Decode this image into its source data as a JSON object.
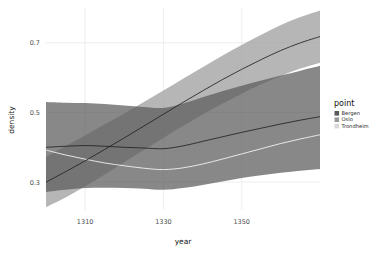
{
  "chart_data": {
    "type": "area",
    "title": "",
    "xlabel": "year",
    "ylabel": "density",
    "xlim": [
      1300,
      1370
    ],
    "ylim": [
      0.22,
      0.8
    ],
    "grid": true,
    "legend_position": "right",
    "legend_title": "point",
    "x_ticks": [
      1310,
      1330,
      1350
    ],
    "x_tick_labels": [
      "1310",
      "1330",
      "1350"
    ],
    "y_ticks": [
      0.3,
      0.5,
      0.7
    ],
    "y_tick_labels": [
      "0.3",
      "0.5",
      "0.7"
    ],
    "colors": {
      "bergen": "#5a5a5a",
      "oslo": "#9a9a9a",
      "trondheim": "#d8d8d8",
      "line": "#222222",
      "panel_background": "#ffffff",
      "grid_line": "#eaeaea",
      "text": "#4d4d4d"
    },
    "x": [
      1300,
      1305,
      1310,
      1315,
      1320,
      1325,
      1330,
      1335,
      1340,
      1345,
      1350,
      1355,
      1360,
      1365,
      1370
    ],
    "series": [
      {
        "name": "Bergen",
        "color": "#5a5a5a",
        "fit": [
          0.4,
          0.403,
          0.405,
          0.403,
          0.4,
          0.398,
          0.396,
          0.404,
          0.417,
          0.43,
          0.443,
          0.455,
          0.467,
          0.478,
          0.488
        ],
        "lower": [
          0.272,
          0.278,
          0.283,
          0.284,
          0.283,
          0.281,
          0.278,
          0.283,
          0.292,
          0.302,
          0.312,
          0.32,
          0.327,
          0.333,
          0.338
        ],
        "upper": [
          0.53,
          0.528,
          0.527,
          0.524,
          0.52,
          0.516,
          0.513,
          0.526,
          0.544,
          0.561,
          0.577,
          0.592,
          0.606,
          0.62,
          0.634
        ]
      },
      {
        "name": "Oslo",
        "color": "#9a9a9a",
        "fit": [
          0.3,
          0.33,
          0.361,
          0.394,
          0.427,
          0.461,
          0.495,
          0.529,
          0.562,
          0.594,
          0.624,
          0.652,
          0.678,
          0.7,
          0.718
        ],
        "lower": [
          0.228,
          0.256,
          0.288,
          0.322,
          0.357,
          0.392,
          0.427,
          0.461,
          0.494,
          0.525,
          0.554,
          0.581,
          0.605,
          0.626,
          0.643
        ],
        "upper": [
          0.372,
          0.404,
          0.434,
          0.466,
          0.497,
          0.53,
          0.563,
          0.597,
          0.63,
          0.663,
          0.694,
          0.723,
          0.751,
          0.774,
          0.793
        ]
      },
      {
        "name": "Trondheim",
        "color": "#d8d8d8",
        "fit": [
          0.392,
          0.378,
          0.366,
          0.355,
          0.347,
          0.34,
          0.336,
          0.341,
          0.352,
          0.366,
          0.381,
          0.396,
          0.411,
          0.424,
          0.436
        ]
      }
    ]
  },
  "legend": {
    "title": "point",
    "items": [
      {
        "label": "Bergen",
        "color": "#5a5a5a"
      },
      {
        "label": "Oslo",
        "color": "#9a9a9a"
      },
      {
        "label": "Trondheim",
        "color": "#d8d8d8"
      }
    ]
  },
  "axes": {
    "x_title": "year",
    "y_title": "density",
    "x_tick_labels": [
      "1310",
      "1330",
      "1350"
    ],
    "y_tick_labels": [
      "0.7",
      "0.5",
      "0.3"
    ]
  }
}
